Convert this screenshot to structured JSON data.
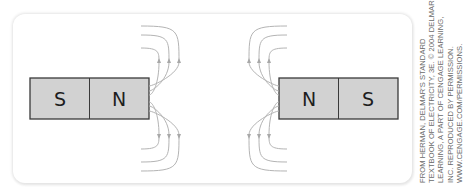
{
  "figure": {
    "left_magnet": {
      "poles": [
        "S",
        "N"
      ],
      "field_side": "right",
      "field_lines_per_side": 3
    },
    "right_magnet": {
      "poles": [
        "N",
        "S"
      ],
      "field_side": "left",
      "field_lines_per_side": 3
    },
    "colors": {
      "magnet_fill": "#d2d2d2",
      "magnet_outline": "#3a3a3a",
      "field_line": "#b4b4b4",
      "panel_background": "#ffffff"
    }
  },
  "credit": {
    "lines": [
      "FROM HERMAN, DELMAR'S STANDARD",
      "TEXTBOOK OF ELECTRICITY, 3E. © 2004 DELMAR",
      "LEARNING, A PART OF CENGAGE LEARNING,",
      "INC. REPRODUCED BY PERMISSION.",
      "WWW.CENGAGE.COM/PERMISSIONS."
    ]
  }
}
